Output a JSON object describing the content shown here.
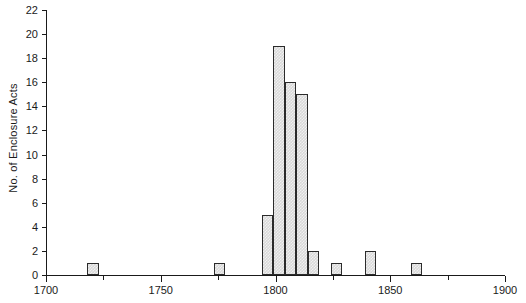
{
  "chart_data": {
    "type": "bar",
    "title": "",
    "subtitle": "",
    "xlabel": "",
    "ylabel": "No. of Enclosure Acts",
    "xlim": [
      1700,
      1900
    ],
    "ylim": [
      0,
      22
    ],
    "grid": false,
    "legend": null,
    "bin_width": 5,
    "x_tick_labels": [
      "1700",
      "1750",
      "1800",
      "1850",
      "1900"
    ],
    "x_tick_values": [
      1700,
      1750,
      1800,
      1850,
      1900
    ],
    "x_minor_tick_values": [
      1725,
      1775,
      1825,
      1875
    ],
    "y_tick_labels": [
      "0",
      "2",
      "4",
      "6",
      "8",
      "10",
      "12",
      "14",
      "16",
      "18",
      "20",
      "22"
    ],
    "y_tick_values": [
      0,
      2,
      4,
      6,
      8,
      10,
      12,
      14,
      16,
      18,
      20,
      22
    ],
    "bars": [
      {
        "bin_start": 1718,
        "bin_end": 1723,
        "value": 1
      },
      {
        "bin_start": 1773,
        "bin_end": 1778,
        "value": 1
      },
      {
        "bin_start": 1794,
        "bin_end": 1799,
        "value": 5
      },
      {
        "bin_start": 1799,
        "bin_end": 1804,
        "value": 19
      },
      {
        "bin_start": 1804,
        "bin_end": 1809,
        "value": 16
      },
      {
        "bin_start": 1809,
        "bin_end": 1814,
        "value": 15
      },
      {
        "bin_start": 1814,
        "bin_end": 1819,
        "value": 2
      },
      {
        "bin_start": 1824,
        "bin_end": 1829,
        "value": 1
      },
      {
        "bin_start": 1839,
        "bin_end": 1844,
        "value": 2
      },
      {
        "bin_start": 1859,
        "bin_end": 1864,
        "value": 1
      }
    ],
    "categories": [
      1720.5,
      1775.5,
      1796.5,
      1801.5,
      1806.5,
      1811.5,
      1816.5,
      1826.5,
      1841.5,
      1861.5
    ],
    "values": [
      1,
      1,
      5,
      19,
      16,
      15,
      2,
      1,
      2,
      1
    ],
    "colors": {
      "axis": "#1a1a1a",
      "bar_outline": "#2b2b2b",
      "bar_fill": "#d8d8d8",
      "background": "#ffffff",
      "text": "#1a1a1a"
    }
  },
  "layout": {
    "plot_left": 46,
    "plot_right": 505,
    "plot_top": 10,
    "plot_bottom": 275
  }
}
